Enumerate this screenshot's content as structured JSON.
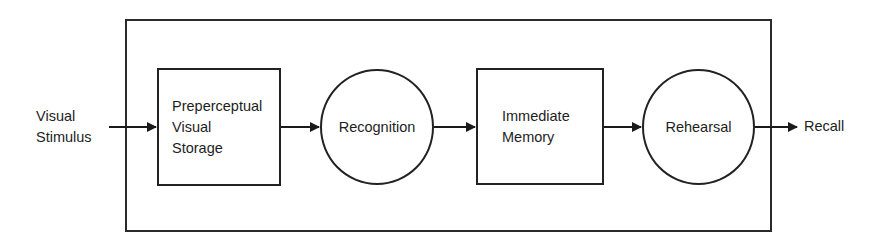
{
  "diagram": {
    "type": "flowchart",
    "direction": "left-to-right",
    "input": {
      "label": "Visual\nStimulus"
    },
    "output": {
      "label": "Recall"
    },
    "nodes": [
      {
        "id": "pvs",
        "shape": "rectangle",
        "label": "Preperceptual\nVisual\nStorage"
      },
      {
        "id": "recognition",
        "shape": "circle",
        "label": "Recognition"
      },
      {
        "id": "immediate_memory",
        "shape": "rectangle",
        "label": "Immediate\nMemory"
      },
      {
        "id": "rehearsal",
        "shape": "circle",
        "label": "Rehearsal"
      }
    ],
    "edges": [
      {
        "from": "Visual Stimulus",
        "to": "Preperceptual Visual Storage"
      },
      {
        "from": "Preperceptual Visual Storage",
        "to": "Recognition"
      },
      {
        "from": "Recognition",
        "to": "Immediate Memory"
      },
      {
        "from": "Immediate Memory",
        "to": "Rehearsal"
      },
      {
        "from": "Rehearsal",
        "to": "Recall"
      }
    ],
    "colors": {
      "stroke": "#222222",
      "background": "#ffffff",
      "text": "#1e1e1e"
    }
  }
}
